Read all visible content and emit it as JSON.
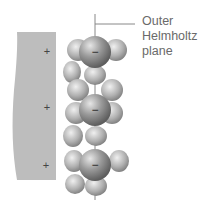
{
  "diagram": {
    "title_label": [
      "Outer",
      "Helmholtz",
      "plane"
    ],
    "electrode_charge_symbol": "+",
    "ion_charge_symbol": "−",
    "electrode_charges": 3,
    "anions": 3,
    "colors": {
      "electrode": "#bdbdbd",
      "ion": "#8a8a8a",
      "water": "#a9a9a9",
      "label": "#6a6a6a"
    }
  }
}
